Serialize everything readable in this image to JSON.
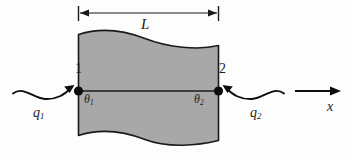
{
  "figure": {
    "type": "engineering-diagram",
    "background_color": "#fdfdfd",
    "element_fill_color": "#a8a8a8",
    "line_color": "#1a1a1a"
  },
  "dimension": {
    "label": "L",
    "description": "element length dimension line with arrowheads at both ends",
    "x_start": 78,
    "x_end": 218,
    "y": 13
  },
  "element": {
    "fill": "#a8a8a8",
    "left_edge_x": 78,
    "right_edge_x": 218,
    "top_edge": "wavy",
    "bottom_edge": "wavy",
    "centerline_y": 91
  },
  "nodes": [
    {
      "name": "node-1",
      "label": "1",
      "x": 78,
      "y": 91,
      "temperature_symbol": "θ",
      "temperature_subscript": "1"
    },
    {
      "name": "node-2",
      "label": "2",
      "x": 218,
      "y": 91,
      "temperature_symbol": "θ",
      "temperature_subscript": "2"
    }
  ],
  "fluxes": [
    {
      "name": "flux-q1",
      "symbol": "q",
      "subscript": "1",
      "direction": "inward-right",
      "arrow": "curved-s-arrow pointing right into node 1"
    },
    {
      "name": "flux-q2",
      "symbol": "q",
      "subscript": "2",
      "direction": "inward-left",
      "arrow": "curved-s-arrow pointing left into node 2"
    }
  ],
  "axis": {
    "label": "x",
    "direction": "right",
    "x_start": 295,
    "x_end": 341,
    "y": 91
  }
}
